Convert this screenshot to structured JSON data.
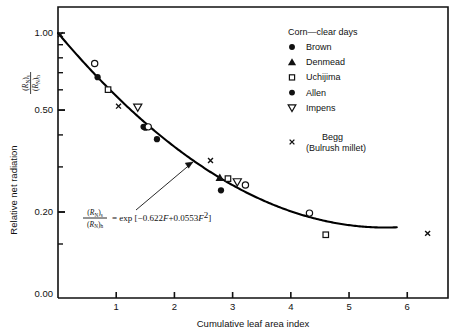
{
  "chart_data": {
    "type": "scatter",
    "title": "",
    "xlabel": "Cumulative leaf area index",
    "ylabel": "Relative net radiation",
    "ylabel_secondary_numerator": "(R",
    "y_axis_scale": "log",
    "xlim": [
      0,
      6.7
    ],
    "ylim_log": [
      0.13,
      1.05
    ],
    "xticks": [
      1,
      2,
      3,
      4,
      5,
      6
    ],
    "xtick_labels": [
      "1",
      "2",
      "3",
      "4",
      "5",
      "6"
    ],
    "yticks": [
      1.0,
      0.5,
      0.2
    ],
    "ytick_labels": [
      "1.00",
      "0.50",
      "0.20"
    ],
    "ytick_zero_label": "0.00",
    "grid": false,
    "legend_position": "top-right",
    "curve": {
      "name": "fitted curve",
      "equation": "exp[-0.622F+0.0553F^2]",
      "coef_linear": -0.622,
      "coef_quadratic": 0.0553,
      "x_start": 0.0,
      "x_end": 5.82
    },
    "annotation": {
      "numerator": "(R",
      "numerator_sub": "N",
      "numerator_close": ")",
      "numerator_sub2": "s",
      "denominator": "(R",
      "denominator_sub": "N",
      "denominator_close": ")",
      "denominator_sub2": "h",
      "equals": "= exp [",
      "body": "−0.622",
      "var1": "F",
      "plus": "+0.0553",
      "var2": "F",
      "exp": "2",
      "close": "]"
    },
    "series": [
      {
        "name": "Brown",
        "marker": "filled-circle",
        "points": [
          [
            0.68,
            0.672
          ],
          [
            1.5,
            0.427
          ],
          [
            1.7,
            0.385
          ],
          [
            2.8,
            0.243
          ]
        ]
      },
      {
        "name": "Denmead",
        "marker": "filled-triangle-up",
        "points": [
          [
            2.78,
            0.272
          ]
        ]
      },
      {
        "name": "Uchijima",
        "marker": "open-square",
        "points": [
          [
            0.86,
            0.601
          ],
          [
            2.92,
            0.27
          ],
          [
            4.6,
            0.163
          ]
        ]
      },
      {
        "name": "Allen",
        "marker": "filled-circle",
        "points": [
          [
            1.47,
            0.43
          ]
        ]
      },
      {
        "name": "Impens",
        "marker": "open-triangle-down",
        "points": [
          [
            1.37,
            0.513
          ],
          [
            3.08,
            0.262
          ]
        ]
      },
      {
        "name": "Begg (Bulrush millet)",
        "marker": "cross-x",
        "points": [
          [
            0.04,
            0.985
          ],
          [
            1.04,
            0.518
          ],
          [
            2.62,
            0.318
          ],
          [
            6.35,
            0.165
          ]
        ]
      },
      {
        "name": "open-circle-unlabeled",
        "marker": "open-circle",
        "points": [
          [
            0.63,
            0.76
          ],
          [
            1.55,
            0.43
          ],
          [
            3.22,
            0.255
          ],
          [
            4.32,
            0.198
          ]
        ]
      }
    ],
    "legend": {
      "title": "Corn—clear days",
      "entries": [
        {
          "label": "Brown",
          "marker": "filled-circle"
        },
        {
          "label": "Denmead",
          "marker": "filled-triangle-up"
        },
        {
          "label": "Uchijima",
          "marker": "open-square"
        },
        {
          "label": "Allen",
          "marker": "filled-circle"
        },
        {
          "label": "Impens",
          "marker": "open-triangle-down"
        }
      ],
      "extra_entry": {
        "marker": "cross-x",
        "label_line1": "Begg",
        "label_line2": "(Bulrush millet)"
      }
    },
    "colors": {
      "foreground": "#111111",
      "background": "#ffffff",
      "curve": "#000000"
    }
  }
}
